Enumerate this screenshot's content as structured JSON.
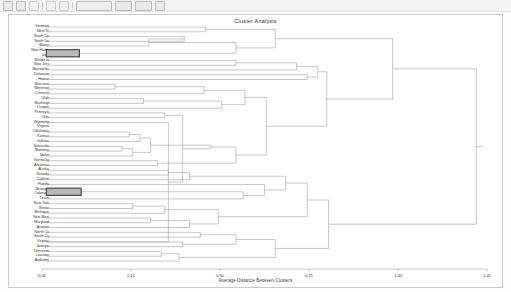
{
  "window": {
    "toolbar_items": [
      "new-icon",
      "open-icon",
      "save-icon",
      "separator",
      "print-icon",
      "undo-icon",
      "separator",
      "group-icon",
      "group-icon",
      "group-icon",
      "group-icon"
    ]
  },
  "chart_data": {
    "type": "dendrogram",
    "title": "Cluster Analysis",
    "xlabel": "Average Distance Between Clusters",
    "ylabel": "",
    "grid": false,
    "legend_position": "none",
    "xlim": [
      0.0,
      1.25
    ],
    "xticks": [
      0.0,
      0.25,
      0.5,
      0.75,
      1.0,
      1.25
    ],
    "xticklabels": [
      "0.00",
      "0.25",
      "0.50",
      "0.75",
      "1.00",
      "1.25"
    ],
    "leaves": [
      "Vermont",
      "West Vi",
      "South Da",
      "North Da",
      "Maine",
      "New Hamp",
      "Iowa",
      "Rhode Is",
      "New Jers",
      "Massachu",
      "Delaware",
      "Hawaii",
      "Wisconsi",
      "Minnesot",
      "Connecti",
      "Utah",
      "Washingt",
      "Oregon",
      "Pennsylv",
      "Ohio",
      "Wyoming",
      "Virginia",
      "Oklahoma",
      "Kansas",
      "Indiana",
      "Nebraska",
      "Montana",
      "Idaho",
      "Kentucky",
      "Arkansas",
      "Alaska",
      "Nevada",
      "Californ",
      "Florida",
      "Missouri",
      "Colorado",
      "Texas",
      "New York",
      "Illinois",
      "Michigan",
      "New Mexi",
      "Maryland",
      "Arizona",
      "North Ca",
      "South Ca",
      "Virginia",
      "Georgia",
      "Tennesse",
      "Louisian",
      "Alabama"
    ],
    "selected_clusters": [
      {
        "leaves": [
          "New Hamp",
          "Iowa"
        ],
        "merge_height": 0.105
      },
      {
        "leaves": [
          "Missouri",
          "Colorado"
        ],
        "merge_height": 0.11
      }
    ],
    "merges": [
      {
        "left": "Vermont",
        "right": "West Vi",
        "height": 0.46
      },
      {
        "left": "South Da",
        "right": "North Da",
        "height": 0.4
      },
      {
        "left": "node",
        "right": "Maine",
        "height": 0.3
      },
      {
        "left": "New Hamp",
        "right": "Iowa",
        "height": 0.105
      },
      {
        "left": "Rhode Is",
        "right": "New Jers",
        "height": 0.55
      },
      {
        "left": "node",
        "right": "Massachu",
        "height": 0.62
      },
      {
        "left": "Wisconsi",
        "right": "Minnesot",
        "height": 0.2
      },
      {
        "left": "Utah",
        "right": "Washingt",
        "height": 0.28
      },
      {
        "left": "Pennsylv",
        "right": "Ohio",
        "height": 0.34
      },
      {
        "left": "Wyoming",
        "right": "Virginia",
        "height": 0.35
      },
      {
        "left": "Oklahoma",
        "right": "Kansas",
        "height": 0.24
      },
      {
        "left": "Missouri",
        "right": "Colorado",
        "height": 0.11
      },
      {
        "left": "root",
        "right": "root",
        "height": 1.22
      }
    ]
  }
}
